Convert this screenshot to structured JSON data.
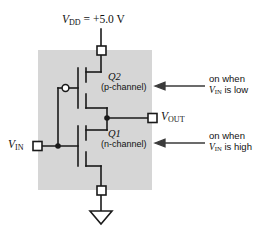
{
  "figure": {
    "type": "circuit-schematic",
    "name": "CMOS inverter",
    "canvas": {
      "width": 267,
      "height": 236
    },
    "colors": {
      "background": "#ffffff",
      "substrate_fill": "#d6d6d6",
      "wire": "#1a1a1a",
      "text": "#111111",
      "terminal_fill": "#ffffff"
    }
  },
  "labels": {
    "supply": {
      "symbol": "V",
      "subscript": "DD",
      "value": " = +5.0 V"
    },
    "output": {
      "symbol": "V",
      "subscript": "OUT"
    },
    "input": {
      "symbol": "V",
      "subscript": "IN"
    },
    "q2": {
      "designator": "Q2",
      "type": "(p-channel)"
    },
    "q1": {
      "designator": "Q1",
      "type": "(n-channel)"
    }
  },
  "annotations": [
    {
      "id": "note-p-channel",
      "line1": "on when",
      "line2_prefix": "V",
      "line2_subscript": "IN",
      "line2_suffix": " is low",
      "arrow": "left-arrow"
    },
    {
      "id": "note-n-channel",
      "line1": "on when",
      "line2_prefix": "V",
      "line2_subscript": "IN",
      "line2_suffix": " is high",
      "arrow": "left-arrow"
    }
  ],
  "nodes": {
    "vdd_terminal": {
      "x": 101,
      "y": 50
    },
    "vout_terminal": {
      "x": 152,
      "y": 118
    },
    "vin_terminal": {
      "x": 38,
      "y": 146
    },
    "ground_terminal": {
      "x": 101,
      "y": 190
    },
    "vout_junction": {
      "x": 107,
      "y": 118
    },
    "vin_junction": {
      "x": 58,
      "y": 146
    },
    "gate_bubble": {
      "x": 65,
      "y": 88
    }
  },
  "substrate_box": {
    "x": 38,
    "y": 50,
    "width": 114,
    "height": 140
  },
  "ground_symbol": {
    "x": 101,
    "y": 212,
    "shape": "triangle"
  }
}
